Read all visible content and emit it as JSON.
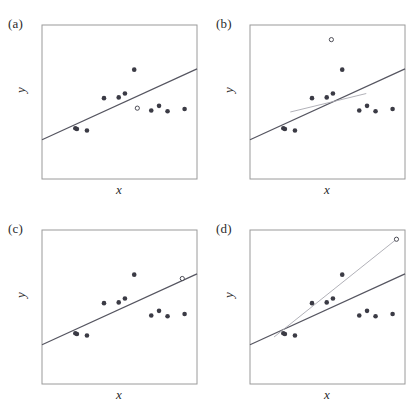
{
  "figure": {
    "background_color": "#ffffff",
    "frame_color": "#9a9a9a",
    "point_color": "#3b3b45",
    "fit_line_color": "#555560",
    "alt_line_color": "#a8a8b0",
    "text_color": "#2b2b2b"
  },
  "chart_data": [
    {
      "type": "scatter",
      "panel": "a",
      "label": "(a)",
      "title": "",
      "xlabel": "x",
      "ylabel": "y",
      "xlim": [
        0,
        10
      ],
      "ylim": [
        0,
        10
      ],
      "grid": false,
      "legend": "none",
      "annotation": "No outlier: open circle point lies within the data cloud and close to the fitted line.",
      "series": [
        {
          "name": "observations",
          "marker": "filled-circle",
          "x": [
            2.15,
            2.25,
            2.9,
            4.0,
            4.95,
            5.35,
            5.95,
            7.05,
            7.55,
            8.1,
            9.2
          ],
          "y": [
            3.3,
            3.25,
            3.15,
            5.25,
            5.3,
            5.55,
            7.1,
            4.45,
            4.75,
            4.4,
            4.55
          ]
        },
        {
          "name": "highlighted-point",
          "marker": "open-circle",
          "x": [
            6.15
          ],
          "y": [
            4.6
          ]
        }
      ],
      "lines": [
        {
          "name": "least-squares-fit",
          "style": "solid-dark",
          "x": [
            0,
            10
          ],
          "y": [
            2.55,
            7.15
          ]
        }
      ]
    },
    {
      "type": "scatter",
      "panel": "b",
      "label": "(b)",
      "title": "",
      "xlabel": "x",
      "ylabel": "y",
      "xlim": [
        0,
        10
      ],
      "ylim": [
        0,
        10
      ],
      "grid": false,
      "legend": "none",
      "annotation": "Vertical outlier: open circle lies far above the cloud at moderate x; fit shifts upward slightly (gray line is fit without the outlier).",
      "series": [
        {
          "name": "observations",
          "marker": "filled-circle",
          "x": [
            2.15,
            2.25,
            2.9,
            4.0,
            4.95,
            5.35,
            5.95,
            7.05,
            7.55,
            8.1,
            9.2
          ],
          "y": [
            3.3,
            3.25,
            3.15,
            5.25,
            5.3,
            5.55,
            7.1,
            4.45,
            4.75,
            4.4,
            4.55
          ]
        },
        {
          "name": "outlier-point",
          "marker": "open-circle",
          "x": [
            5.25
          ],
          "y": [
            9.05
          ]
        }
      ],
      "lines": [
        {
          "name": "fit-with-outlier",
          "style": "solid-dark",
          "x": [
            0,
            10
          ],
          "y": [
            2.55,
            7.15
          ]
        },
        {
          "name": "fit-without-outlier",
          "style": "solid-gray",
          "x": [
            2.6,
            7.5
          ],
          "y": [
            4.35,
            5.55
          ]
        }
      ]
    },
    {
      "type": "scatter",
      "panel": "c",
      "label": "(c)",
      "title": "",
      "xlabel": "x",
      "ylabel": "y",
      "xlim": [
        0,
        10
      ],
      "ylim": [
        0,
        10
      ],
      "grid": false,
      "legend": "none",
      "annotation": "High leverage, not influential: open circle sits at extreme x but on the line, so the fit is unchanged.",
      "series": [
        {
          "name": "observations",
          "marker": "filled-circle",
          "x": [
            2.15,
            2.25,
            2.9,
            4.0,
            4.95,
            5.35,
            5.95,
            7.05,
            7.55,
            8.1,
            9.2
          ],
          "y": [
            3.3,
            3.25,
            3.15,
            5.25,
            5.3,
            5.55,
            7.1,
            4.45,
            4.75,
            4.4,
            4.55
          ]
        },
        {
          "name": "leverage-point",
          "marker": "open-circle",
          "x": [
            9.05
          ],
          "y": [
            6.85
          ]
        }
      ],
      "lines": [
        {
          "name": "least-squares-fit",
          "style": "solid-dark",
          "x": [
            0,
            10
          ],
          "y": [
            2.55,
            7.15
          ]
        }
      ]
    },
    {
      "type": "scatter",
      "panel": "d",
      "label": "(d)",
      "title": "",
      "xlabel": "x",
      "ylabel": "y",
      "xlim": [
        0,
        10
      ],
      "ylim": [
        0,
        10
      ],
      "grid": false,
      "legend": "none",
      "annotation": "Influential point: open circle at extreme x and high y drags the fitted slope upward (gray line); dark line is the fit without it.",
      "series": [
        {
          "name": "observations",
          "marker": "filled-circle",
          "x": [
            2.15,
            2.25,
            2.9,
            4.0,
            4.95,
            5.35,
            5.95,
            7.05,
            7.55,
            8.1,
            9.2
          ],
          "y": [
            3.3,
            3.25,
            3.15,
            5.25,
            5.3,
            5.55,
            7.1,
            4.45,
            4.75,
            4.4,
            4.55
          ]
        },
        {
          "name": "influential-point",
          "marker": "open-circle",
          "x": [
            9.45
          ],
          "y": [
            9.4
          ]
        }
      ],
      "lines": [
        {
          "name": "fit-without-influential-point",
          "style": "solid-dark",
          "x": [
            0,
            10
          ],
          "y": [
            2.55,
            7.15
          ]
        },
        {
          "name": "fit-with-influential-point",
          "style": "solid-gray",
          "x": [
            1.55,
            9.45
          ],
          "y": [
            3.05,
            9.4
          ]
        }
      ]
    }
  ]
}
